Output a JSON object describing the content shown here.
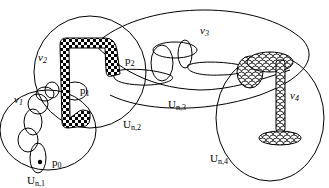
{
  "diagram": {
    "type": "topological-neighborhood-chain",
    "regions": [
      {
        "id": "U_n1",
        "label": "U",
        "subscript": "n,1"
      },
      {
        "id": "U_n2",
        "label": "U",
        "subscript": "n,2"
      },
      {
        "id": "U_n3",
        "label": "U",
        "subscript": "n,3"
      },
      {
        "id": "U_n4",
        "label": "U",
        "subscript": "n,4"
      }
    ],
    "points": [
      {
        "id": "p0",
        "label": "p",
        "subscript": "0"
      },
      {
        "id": "p1",
        "label": "p",
        "subscript": "1"
      },
      {
        "id": "p2",
        "label": "p",
        "subscript": "2"
      }
    ],
    "paths": [
      {
        "id": "nu1",
        "label": "ν",
        "subscript": "1",
        "style": "chain of ellipses"
      },
      {
        "id": "nu2",
        "label": "ν",
        "subscript": "2",
        "style": "checkerboard tube"
      },
      {
        "id": "nu3",
        "label": "ν",
        "subscript": "3",
        "style": "linked loops"
      },
      {
        "id": "nu4",
        "label": "ν",
        "subscript": "4",
        "style": "scale-pattern tube"
      }
    ]
  }
}
